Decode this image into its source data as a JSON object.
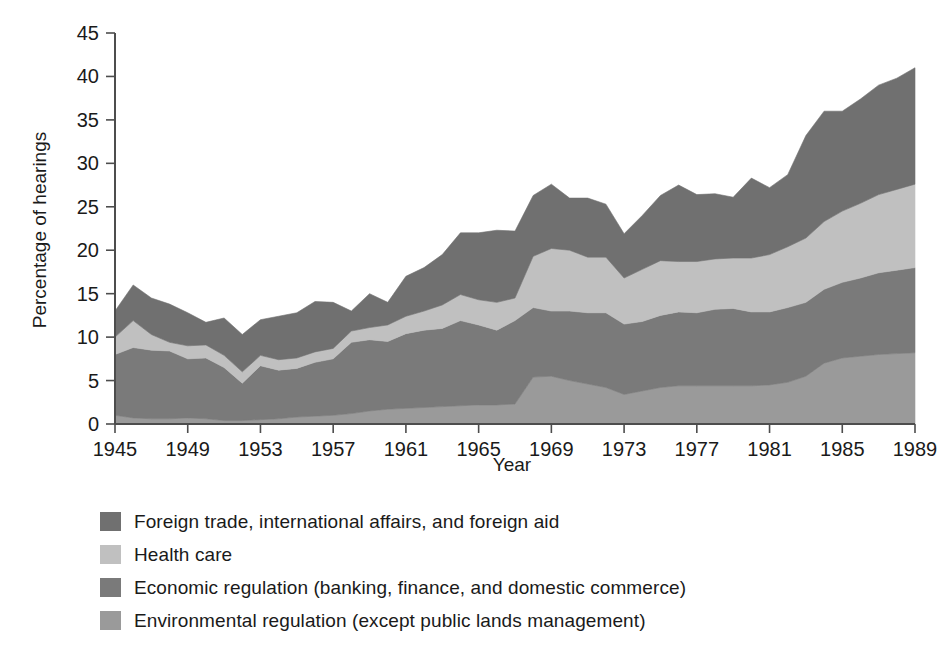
{
  "chart_data": {
    "type": "area",
    "stacked": true,
    "title": "",
    "xlabel": "Year",
    "ylabel": "Percentage of hearings",
    "xlim": [
      1945,
      1989
    ],
    "ylim": [
      0,
      45
    ],
    "ytick_step": 5,
    "xtick_step": 4,
    "grid": false,
    "legend_position": "below",
    "yticks": [
      0,
      5,
      10,
      15,
      20,
      25,
      30,
      35,
      40,
      45
    ],
    "xticks": [
      1945,
      1949,
      1953,
      1957,
      1961,
      1965,
      1969,
      1973,
      1977,
      1981,
      1985,
      1989
    ],
    "xtick_labels": [
      "1945",
      "1949",
      "1953",
      "1957",
      "1961",
      "1965",
      "1969",
      "1973",
      "1977",
      "1981",
      "1985",
      "1989"
    ],
    "ytick_labels": [
      "0",
      "5",
      "10",
      "15",
      "20",
      "25",
      "30",
      "35",
      "40",
      "45"
    ],
    "x": [
      1945,
      1946,
      1947,
      1948,
      1949,
      1950,
      1951,
      1952,
      1953,
      1954,
      1955,
      1956,
      1957,
      1958,
      1959,
      1960,
      1961,
      1962,
      1963,
      1964,
      1965,
      1966,
      1967,
      1968,
      1969,
      1970,
      1971,
      1972,
      1973,
      1974,
      1975,
      1976,
      1977,
      1978,
      1979,
      1980,
      1981,
      1982,
      1983,
      1984,
      1985,
      1986,
      1987,
      1988,
      1989
    ],
    "stack_order_bottom_to_top": [
      "Environmental regulation (except public lands management)",
      "Economic regulation (banking, finance, and domestic commerce)",
      "Health care",
      "Foreign trade, international affairs, and foreign aid"
    ],
    "series": [
      {
        "name": "Environmental regulation (except public lands management)",
        "color": "#9a9a9a",
        "values": [
          1.0,
          0.7,
          0.6,
          0.6,
          0.7,
          0.6,
          0.4,
          0.4,
          0.5,
          0.6,
          0.8,
          0.9,
          1.0,
          1.2,
          1.5,
          1.7,
          1.8,
          1.9,
          2.0,
          2.1,
          2.2,
          2.2,
          2.3,
          5.4,
          5.5,
          5.0,
          4.6,
          4.2,
          3.4,
          3.8,
          4.2,
          4.4,
          4.4,
          4.4,
          4.4,
          4.4,
          4.5,
          4.8,
          5.5,
          7.0,
          7.6,
          7.8,
          8.0,
          8.1,
          8.2
        ]
      },
      {
        "name": "Economic regulation (banking, finance, and domestic commerce)",
        "color": "#7a7a7a",
        "values": [
          7.0,
          8.1,
          7.9,
          7.8,
          6.8,
          7.0,
          6.1,
          4.3,
          6.2,
          5.6,
          5.6,
          6.2,
          6.5,
          8.2,
          8.2,
          7.8,
          8.6,
          8.9,
          9.0,
          9.8,
          9.2,
          8.6,
          9.6,
          8.0,
          7.5,
          8.0,
          8.2,
          8.6,
          8.1,
          8.0,
          8.3,
          8.5,
          8.4,
          8.8,
          8.9,
          8.5,
          8.4,
          8.6,
          8.5,
          8.5,
          8.7,
          9.0,
          9.4,
          9.6,
          9.8
        ]
      },
      {
        "name": "Health care",
        "color": "#c0c0c0",
        "values": [
          2.0,
          3.1,
          1.8,
          1.0,
          1.5,
          1.5,
          1.4,
          1.3,
          1.2,
          1.2,
          1.2,
          1.2,
          1.2,
          1.3,
          1.4,
          1.9,
          2.0,
          2.2,
          2.7,
          3.0,
          2.9,
          3.2,
          2.6,
          5.9,
          7.2,
          7.0,
          6.4,
          6.4,
          5.3,
          6.0,
          6.3,
          5.8,
          5.9,
          5.8,
          5.8,
          6.2,
          6.6,
          7.0,
          7.4,
          7.8,
          8.2,
          8.6,
          9.0,
          9.3,
          9.6
        ]
      },
      {
        "name": "Foreign trade, international affairs, and foreign aid",
        "color": "#707070",
        "values": [
          3.0,
          4.1,
          4.2,
          4.4,
          3.8,
          2.6,
          4.3,
          4.3,
          4.1,
          5.0,
          5.2,
          5.8,
          5.3,
          2.3,
          3.9,
          2.6,
          4.6,
          5.0,
          5.8,
          7.1,
          7.7,
          8.3,
          7.7,
          7.0,
          7.4,
          6.0,
          6.8,
          6.1,
          5.1,
          6.2,
          7.5,
          8.8,
          7.7,
          7.5,
          7.0,
          9.2,
          7.7,
          8.3,
          11.8,
          12.7,
          11.5,
          12.0,
          12.6,
          12.8,
          13.4
        ]
      }
    ]
  },
  "legend": {
    "items": [
      {
        "label": "Foreign trade, international affairs, and foreign aid",
        "color": "#707070"
      },
      {
        "label": "Health care",
        "color": "#c0c0c0"
      },
      {
        "label": "Economic regulation (banking, finance, and domestic commerce)",
        "color": "#7a7a7a"
      },
      {
        "label": "Environmental regulation (except public lands management)",
        "color": "#9a9a9a"
      }
    ]
  },
  "axes": {
    "x_title": "Year",
    "y_title": "Percentage of hearings"
  }
}
